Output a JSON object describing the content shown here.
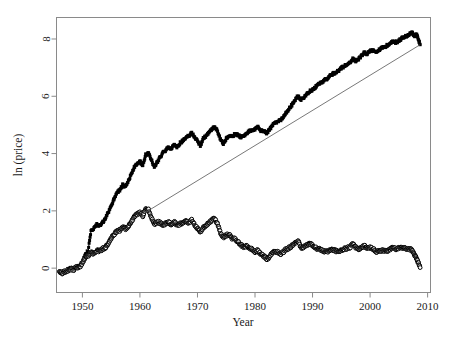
{
  "chart_data": {
    "type": "line",
    "title": "",
    "subtitle": "",
    "xlabel": "Year",
    "ylabel": "ln (price)",
    "xlim": [
      1945.5,
      2010.5
    ],
    "ylim": [
      -0.85,
      8.75
    ],
    "xticks": [
      1950,
      1960,
      1970,
      1980,
      1990,
      2000,
      2010
    ],
    "xticklabels": [
      "1950",
      "1960",
      "1970",
      "1980",
      "1990",
      "2000",
      "2010"
    ],
    "yticks": [
      0,
      2,
      4,
      6,
      8
    ],
    "yticklabels": [
      "0",
      "2",
      "4",
      "6",
      "8"
    ],
    "grid": false,
    "legend": "none",
    "box": true,
    "series": [
      {
        "name": "nominal-price-log",
        "marker": "filled-square",
        "marker_color": "#000000",
        "line_color": "#000000",
        "x": [
          1946.0,
          1946.5,
          1947.0,
          1947.5,
          1948.0,
          1948.5,
          1949.0,
          1949.5,
          1950.0,
          1950.5,
          1951.0,
          1951.5,
          1952.0,
          1952.5,
          1953.0,
          1953.5,
          1954.0,
          1954.5,
          1955.0,
          1955.5,
          1956.0,
          1956.5,
          1957.0,
          1957.5,
          1958.0,
          1958.5,
          1959.0,
          1959.5,
          1960.0,
          1960.5,
          1961.0,
          1961.5,
          1962.0,
          1962.5,
          1963.0,
          1963.5,
          1964.0,
          1964.5,
          1965.0,
          1965.5,
          1966.0,
          1966.5,
          1967.0,
          1967.5,
          1968.0,
          1968.5,
          1969.0,
          1969.5,
          1970.0,
          1970.5,
          1971.0,
          1971.5,
          1972.0,
          1972.5,
          1973.0,
          1973.5,
          1974.0,
          1974.5,
          1975.0,
          1975.5,
          1976.0,
          1976.5,
          1977.0,
          1977.5,
          1978.0,
          1978.5,
          1979.0,
          1979.5,
          1980.0,
          1980.5,
          1981.0,
          1981.5,
          1982.0,
          1982.5,
          1983.0,
          1983.5,
          1984.0,
          1984.5,
          1985.0,
          1985.5,
          1986.0,
          1986.5,
          1987.0,
          1987.5,
          1988.0,
          1988.5,
          1989.0,
          1989.5,
          1990.0,
          1990.5,
          1991.0,
          1991.5,
          1992.0,
          1992.5,
          1993.0,
          1993.5,
          1994.0,
          1994.5,
          1995.0,
          1995.5,
          1996.0,
          1996.5,
          1997.0,
          1997.5,
          1998.0,
          1998.5,
          1999.0,
          1999.5,
          2000.0,
          2000.5,
          2001.0,
          2001.5,
          2002.0,
          2002.5,
          2003.0,
          2003.5,
          2004.0,
          2004.5,
          2005.0,
          2005.5,
          2006.0,
          2006.5,
          2007.0,
          2007.3,
          2007.7,
          2008.0,
          2008.3,
          2008.7
        ],
        "y": [
          -0.12,
          -0.15,
          -0.1,
          -0.05,
          0.02,
          -0.04,
          0.08,
          0.05,
          0.22,
          0.45,
          0.62,
          1.32,
          1.4,
          1.52,
          1.48,
          1.58,
          1.72,
          1.95,
          2.18,
          2.42,
          2.65,
          2.72,
          2.9,
          2.82,
          3.05,
          3.28,
          3.52,
          3.62,
          3.72,
          3.58,
          3.95,
          4.02,
          3.78,
          3.52,
          3.7,
          3.88,
          4.02,
          4.12,
          4.22,
          4.18,
          4.32,
          4.22,
          4.38,
          4.45,
          4.55,
          4.62,
          4.72,
          4.58,
          4.45,
          4.28,
          4.52,
          4.62,
          4.72,
          4.85,
          4.92,
          4.78,
          4.48,
          4.35,
          4.52,
          4.62,
          4.58,
          4.68,
          4.65,
          4.58,
          4.62,
          4.7,
          4.78,
          4.82,
          4.85,
          4.92,
          4.8,
          4.78,
          4.72,
          4.82,
          4.98,
          5.08,
          5.12,
          5.18,
          5.32,
          5.45,
          5.58,
          5.72,
          5.88,
          6.02,
          5.88,
          5.95,
          6.08,
          6.18,
          6.22,
          6.32,
          6.42,
          6.48,
          6.55,
          6.62,
          6.7,
          6.78,
          6.82,
          6.9,
          6.98,
          7.05,
          7.12,
          7.18,
          7.32,
          7.22,
          7.3,
          7.42,
          7.52,
          7.48,
          7.58,
          7.62,
          7.55,
          7.62,
          7.68,
          7.72,
          7.78,
          7.85,
          7.92,
          7.88,
          7.95,
          8.02,
          8.08,
          8.12,
          8.18,
          8.22,
          8.1,
          8.18,
          8.05,
          7.8
        ]
      },
      {
        "name": "real-price-log",
        "marker": "open-circle",
        "marker_color": "#000000",
        "line_color": "#000000",
        "x": [
          1946.0,
          1946.5,
          1947.0,
          1947.5,
          1948.0,
          1948.5,
          1949.0,
          1949.5,
          1950.0,
          1950.5,
          1951.0,
          1951.5,
          1952.0,
          1952.5,
          1953.0,
          1953.5,
          1954.0,
          1954.5,
          1955.0,
          1955.5,
          1956.0,
          1956.5,
          1957.0,
          1957.5,
          1958.0,
          1958.5,
          1959.0,
          1959.5,
          1960.0,
          1960.5,
          1961.0,
          1961.5,
          1962.0,
          1962.5,
          1963.0,
          1963.5,
          1964.0,
          1964.5,
          1965.0,
          1965.5,
          1966.0,
          1966.5,
          1967.0,
          1967.5,
          1968.0,
          1968.5,
          1969.0,
          1969.5,
          1970.0,
          1970.5,
          1971.0,
          1971.5,
          1972.0,
          1972.5,
          1973.0,
          1973.5,
          1974.0,
          1974.5,
          1975.0,
          1975.5,
          1976.0,
          1976.5,
          1977.0,
          1977.5,
          1978.0,
          1978.5,
          1979.0,
          1979.5,
          1980.0,
          1980.5,
          1981.0,
          1981.5,
          1982.0,
          1982.5,
          1983.0,
          1983.5,
          1984.0,
          1984.5,
          1985.0,
          1985.5,
          1986.0,
          1986.5,
          1987.0,
          1987.5,
          1988.0,
          1988.5,
          1989.0,
          1989.5,
          1990.0,
          1990.5,
          1991.0,
          1991.5,
          1992.0,
          1992.5,
          1993.0,
          1993.5,
          1994.0,
          1994.5,
          1995.0,
          1995.5,
          1996.0,
          1996.5,
          1997.0,
          1997.5,
          1998.0,
          1998.5,
          1999.0,
          1999.5,
          2000.0,
          2000.5,
          2001.0,
          2001.5,
          2002.0,
          2002.5,
          2003.0,
          2003.5,
          2004.0,
          2004.5,
          2005.0,
          2005.5,
          2006.0,
          2006.5,
          2007.0,
          2007.3,
          2007.7,
          2008.0,
          2008.3,
          2008.7
        ],
        "y": [
          -0.14,
          -0.17,
          -0.12,
          -0.08,
          -0.02,
          -0.06,
          0.05,
          0.02,
          0.18,
          0.35,
          0.42,
          0.55,
          0.5,
          0.62,
          0.58,
          0.68,
          0.72,
          0.88,
          1.02,
          1.18,
          1.28,
          1.32,
          1.45,
          1.38,
          1.48,
          1.62,
          1.78,
          1.88,
          1.95,
          1.82,
          2.1,
          2.05,
          1.78,
          1.52,
          1.62,
          1.58,
          1.52,
          1.55,
          1.6,
          1.52,
          1.62,
          1.48,
          1.55,
          1.58,
          1.62,
          1.58,
          1.68,
          1.52,
          1.38,
          1.25,
          1.42,
          1.5,
          1.58,
          1.68,
          1.72,
          1.55,
          1.22,
          1.08,
          1.15,
          1.18,
          1.05,
          1.02,
          0.92,
          0.82,
          0.75,
          0.78,
          0.72,
          0.65,
          0.58,
          0.62,
          0.48,
          0.42,
          0.32,
          0.38,
          0.52,
          0.58,
          0.55,
          0.5,
          0.58,
          0.68,
          0.72,
          0.8,
          0.88,
          0.95,
          0.72,
          0.75,
          0.82,
          0.85,
          0.8,
          0.72,
          0.68,
          0.62,
          0.6,
          0.58,
          0.62,
          0.65,
          0.6,
          0.58,
          0.62,
          0.68,
          0.7,
          0.72,
          0.85,
          0.72,
          0.68,
          0.72,
          0.78,
          0.7,
          0.72,
          0.68,
          0.58,
          0.6,
          0.62,
          0.58,
          0.62,
          0.66,
          0.72,
          0.68,
          0.7,
          0.72,
          0.7,
          0.68,
          0.66,
          0.62,
          0.48,
          0.4,
          0.22,
          0.02
        ]
      }
    ],
    "trendline": {
      "name": "reference-trend-line",
      "color": "#555555",
      "x_start": 1961.0,
      "y_start": 1.95,
      "x_end": 2008.7,
      "y_end": 7.8
    }
  }
}
